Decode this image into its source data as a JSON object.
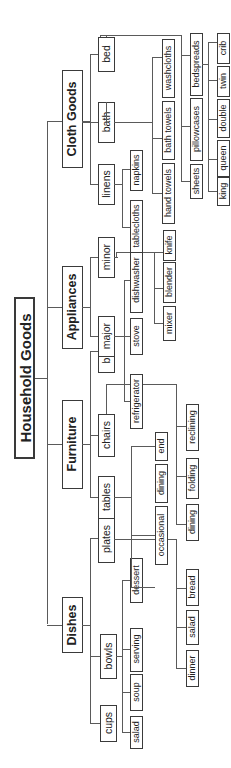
{
  "diagram": {
    "title": "Household Goods",
    "orientation": "rotated-90-ccw",
    "categories": [
      {
        "label": "Dishes",
        "children": [
          {
            "label": "cups",
            "children": []
          },
          {
            "label": "bowls",
            "children": [
              "salad",
              "soup",
              "serving",
              "dessert"
            ]
          },
          {
            "label": "plates",
            "children": [
              "dinner",
              "salad",
              "bread"
            ]
          }
        ]
      },
      {
        "label": "Furniture",
        "children": [
          {
            "label": "tables",
            "children": [
              "occasional",
              "dining",
              "end"
            ]
          },
          {
            "label": "chairs",
            "children": [
              "dining",
              "folding",
              "reclining"
            ]
          },
          {
            "label": "beds",
            "children": []
          }
        ]
      },
      {
        "label": "Appliances",
        "children": [
          {
            "label": "major",
            "children": [
              "refrigerator",
              "stove",
              "dishwasher"
            ]
          },
          {
            "label": "minor",
            "children": [
              "mixer",
              "blender",
              "knife"
            ]
          }
        ]
      },
      {
        "label": "Cloth Goods",
        "children": [
          {
            "label": "linens",
            "children": [
              "tablecloths",
              "napkins"
            ]
          },
          {
            "label": "bath",
            "children": [
              "hand towels",
              "bath towels",
              "washcloths"
            ]
          },
          {
            "label": "bed",
            "children": [
              "sheets",
              "pillowcases",
              "bedspreads"
            ]
          }
        ],
        "bed_sizes": [
          "king",
          "queen",
          "double",
          "twin",
          "crib"
        ]
      }
    ]
  }
}
